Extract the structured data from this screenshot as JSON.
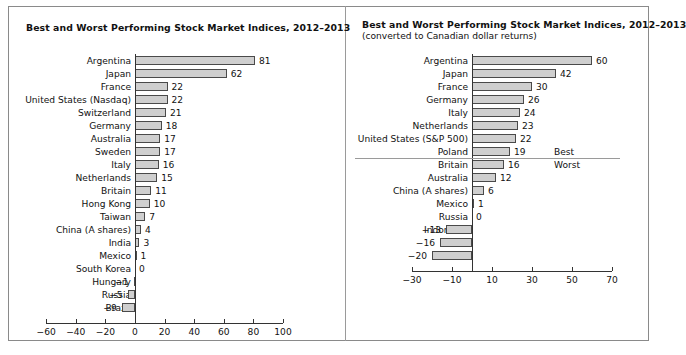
{
  "chart_data": [
    {
      "type": "bar",
      "orientation": "horizontal",
      "title": "Best and Worst Performing Stock Market Indices, 2012–2013",
      "subtitle": "",
      "xlabel": "",
      "ylabel": "",
      "xlim": [
        -60,
        100
      ],
      "xticks": [
        -60,
        -40,
        -20,
        0,
        20,
        40,
        60,
        80,
        100
      ],
      "xtick_labels": [
        "−60",
        "−40",
        "−20",
        "0",
        "20",
        "40",
        "60",
        "80",
        "100"
      ],
      "grid": false,
      "legend": "none",
      "bar_color": "#cfcfcf",
      "bar_border_color": "#4a4a4a",
      "categories": [
        "Argentina",
        "Japan",
        "France",
        "United States (Nasdaq)",
        "Switzerland",
        "Germany",
        "Australia",
        "Sweden",
        "Italy",
        "Netherlands",
        "Britain",
        "Hong Kong",
        "Taiwan",
        "China (A shares)",
        "India",
        "Mexico",
        "South Korea",
        "Hungary",
        "Russia",
        "Brazil"
      ],
      "values": [
        81,
        62,
        22,
        22,
        21,
        18,
        17,
        17,
        16,
        15,
        11,
        10,
        7,
        4,
        3,
        1,
        0,
        -1,
        -5,
        -9
      ],
      "value_labels": [
        "81",
        "62",
        "22",
        "22",
        "21",
        "18",
        "17",
        "17",
        "16",
        "15",
        "11",
        "10",
        "7",
        "4",
        "3",
        "1",
        "0",
        "−1",
        "−5",
        "−9"
      ]
    },
    {
      "type": "bar",
      "orientation": "horizontal",
      "title": "Best and Worst Performing Stock Market Indices, 2012–2013",
      "subtitle": "(converted to Canadian dollar returns)",
      "xlabel": "",
      "ylabel": "",
      "xlim": [
        -40,
        70
      ],
      "xticks": [
        -30,
        -10,
        10,
        30,
        50,
        70
      ],
      "xtick_labels": [
        "−30",
        "−10",
        "10",
        "30",
        "50",
        "70"
      ],
      "grid": false,
      "legend": "none",
      "bar_color": "#cfcfcf",
      "bar_border_color": "#4a4a4a",
      "annotations": [
        {
          "text": "Best",
          "after_category": "Poland"
        },
        {
          "text": "Worst",
          "after_category": "Britain"
        }
      ],
      "divider_after_category": "Poland",
      "categories": [
        "Argentina",
        "Japan",
        "France",
        "Germany",
        "Italy",
        "Netherlands",
        "United States (S&P 500)",
        "Poland",
        "Britain",
        "Australia",
        "China (A shares)",
        "Mexico",
        "Russia",
        "Indonesia",
        "Brazil",
        "India"
      ],
      "values": [
        60,
        42,
        30,
        26,
        24,
        23,
        22,
        19,
        16,
        12,
        6,
        1,
        0,
        -13,
        -16,
        -20
      ],
      "value_labels": [
        "60",
        "42",
        "30",
        "26",
        "24",
        "23",
        "22",
        "19",
        "16",
        "12",
        "6",
        "1",
        "0",
        "−13",
        "−16",
        "−20"
      ]
    }
  ],
  "left_panel": {
    "title": "Best and Worst Performing Stock Market Indices, 2012–2013"
  },
  "right_panel": {
    "title": "Best and Worst Performing Stock Market Indices, 2012–2013",
    "subtitle": "(converted to Canadian dollar returns)",
    "best_label": "Best",
    "worst_label": "Worst"
  },
  "colors": {
    "bar_fill": "#cfcfcf",
    "bar_stroke": "#4a4a4a",
    "axis": "#333333",
    "frame": "#8a8a8a",
    "text": "#111111",
    "background": "#ffffff"
  }
}
